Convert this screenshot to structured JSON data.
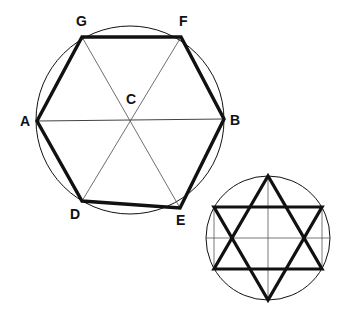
{
  "figure": {
    "background_color": "#ffffff",
    "ink_color": "#111111",
    "thick_stroke_color": "#111111",
    "thin_stroke_color": "#444444",
    "thick_stroke_width": "3.2",
    "thin_stroke_width": "0.8",
    "circle_stroke_width": "1.0"
  },
  "main_figure": {
    "name": "hexagon-in-circle",
    "circle": {
      "cx": 130,
      "cy": 120,
      "r": 94
    },
    "center_point": {
      "id": "C",
      "x": 130,
      "y": 120
    },
    "vertices": [
      {
        "id": "A",
        "x": 37,
        "y": 121,
        "label_x": 20,
        "label_y": 126
      },
      {
        "id": "G",
        "x": 82,
        "y": 37,
        "label_x": 76,
        "label_y": 26
      },
      {
        "id": "F",
        "x": 181,
        "y": 37,
        "label_x": 179,
        "label_y": 26
      },
      {
        "id": "B",
        "x": 224,
        "y": 119,
        "label_x": 230,
        "label_y": 125
      },
      {
        "id": "E",
        "x": 180,
        "y": 208,
        "label_x": 176,
        "label_y": 225
      },
      {
        "id": "D",
        "x": 82,
        "y": 201,
        "label_x": 70,
        "label_y": 219
      }
    ],
    "hexagon_order": [
      "A",
      "G",
      "F",
      "B",
      "E",
      "D"
    ],
    "diameters": [
      {
        "from": "A",
        "to": "B"
      },
      {
        "from": "G",
        "to": "E"
      },
      {
        "from": "F",
        "to": "D"
      }
    ],
    "center_label": {
      "text": "C",
      "x": 126,
      "y": 104
    },
    "labels": [
      "A",
      "B",
      "C",
      "D",
      "E",
      "F",
      "G"
    ]
  },
  "small_figure": {
    "name": "hexagram-in-circle",
    "circle": {
      "cx": 268,
      "cy": 238,
      "r": 62
    },
    "triangle_up": [
      {
        "x": 268,
        "y": 176
      },
      {
        "x": 214,
        "y": 269
      },
      {
        "x": 322,
        "y": 269
      }
    ],
    "triangle_down": [
      {
        "x": 268,
        "y": 300
      },
      {
        "x": 214,
        "y": 207
      },
      {
        "x": 322,
        "y": 207
      }
    ],
    "thin_lines": [
      {
        "x1": 268,
        "y1": 176,
        "x2": 268,
        "y2": 300
      },
      {
        "x1": 214,
        "y1": 207,
        "x2": 214,
        "y2": 269
      },
      {
        "x1": 322,
        "y1": 207,
        "x2": 322,
        "y2": 269
      },
      {
        "x1": 206,
        "y1": 238,
        "x2": 330,
        "y2": 238
      },
      {
        "x1": 268,
        "y1": 176,
        "x2": 322,
        "y2": 269
      },
      {
        "x1": 268,
        "y1": 176,
        "x2": 214,
        "y2": 269
      },
      {
        "x1": 268,
        "y1": 300,
        "x2": 322,
        "y2": 207
      },
      {
        "x1": 268,
        "y1": 300,
        "x2": 214,
        "y2": 207
      },
      {
        "x1": 214,
        "y1": 207,
        "x2": 322,
        "y2": 207
      },
      {
        "x1": 214,
        "y1": 269,
        "x2": 322,
        "y2": 269
      }
    ]
  }
}
